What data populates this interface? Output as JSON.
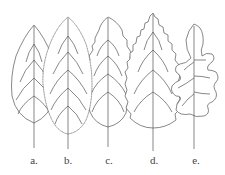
{
  "figure": {
    "leaves": [
      {
        "id": "a",
        "label": "a.",
        "margin": "entire",
        "x": 34
      },
      {
        "id": "b",
        "label": "b.",
        "margin": "serrulate",
        "x": 68
      },
      {
        "id": "c",
        "label": "c.",
        "margin": "crenate",
        "x": 108
      },
      {
        "id": "d",
        "label": "d.",
        "margin": "serrate",
        "x": 153
      },
      {
        "id": "e",
        "label": "e.",
        "margin": "lobed",
        "x": 194
      }
    ],
    "stroke_color": "#555555"
  }
}
